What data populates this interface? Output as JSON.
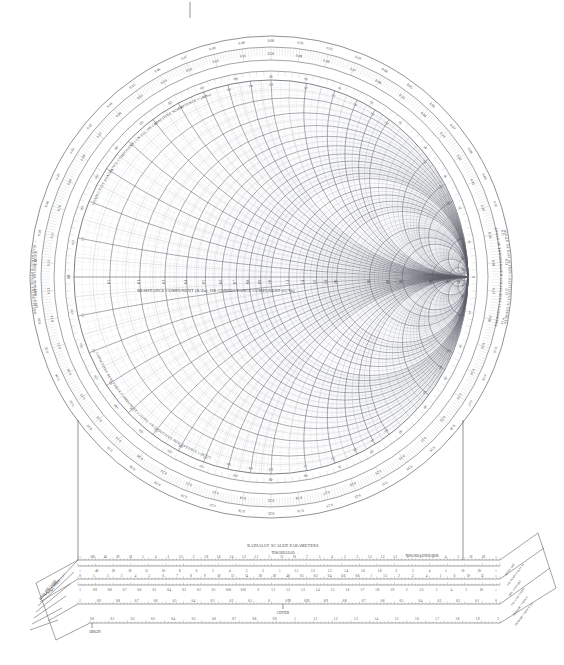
{
  "chart_data": {
    "type": "smith-chart",
    "center_label": "RESISTANCE COMPONENT (R/Zo), OR CONDUCTANCE COMPONENT (G/Yo)",
    "arc_labels": {
      "upper_left": "INDUCTIVE REACTANCE COMPONENT (+jX/Zo), OR CAPACITIVE SUSCEPTANCE (+jB/Yo)",
      "lower_left": "CAPACITIVE REACTANCE COMPONENT (-jX/Zo), OR INDUCTIVE SUSCEPTANCE (-jB/Yo)",
      "outer_left_upper": "WAVELENGTHS TOWARD GENERATOR →",
      "outer_left_lower": "← WAVELENGTHS TOWARD LOAD",
      "outer_right_upper": "ANGLE OF REFLECTION COEFFICIENT IN DEGREES",
      "outer_right_lower": "ANGLE OF TRANSMISSION COEFFICIENT IN DEGREES"
    },
    "resistance_circles": [
      0,
      0.1,
      0.2,
      0.3,
      0.4,
      0.5,
      0.6,
      0.7,
      0.8,
      0.9,
      1.0,
      1.2,
      1.4,
      1.6,
      1.8,
      2.0,
      3.0,
      4.0,
      5.0,
      10.0,
      20.0,
      50.0
    ],
    "resistance_minor": [
      0.05,
      0.15,
      0.25,
      0.35,
      0.45,
      0.55,
      0.65,
      0.75,
      0.85,
      0.95,
      1.1,
      1.3,
      1.5,
      1.7,
      1.9,
      2.2,
      2.4,
      2.6,
      2.8,
      3.2,
      3.4,
      3.6,
      3.8,
      4.5,
      6,
      7,
      8,
      9,
      12,
      14,
      16,
      18,
      30,
      40
    ],
    "reactance_arcs": [
      0.1,
      0.2,
      0.3,
      0.4,
      0.5,
      0.6,
      0.7,
      0.8,
      0.9,
      1.0,
      1.2,
      1.4,
      1.6,
      1.8,
      2.0,
      3.0,
      4.0,
      5.0,
      10.0,
      20.0,
      50.0
    ],
    "reactance_minor": [
      0.05,
      0.15,
      0.25,
      0.35,
      0.45,
      0.55,
      0.65,
      0.75,
      0.85,
      0.95,
      1.1,
      1.3,
      1.5,
      1.7,
      1.9,
      2.2,
      2.4,
      2.6,
      2.8,
      3.2,
      3.4,
      3.6,
      3.8,
      4.5,
      6,
      7,
      8,
      9,
      12,
      14,
      16,
      18,
      30,
      40
    ],
    "axis_tick_labels": [
      "0.1",
      "0.2",
      "0.3",
      "0.4",
      "0.5",
      "0.6",
      "0.7",
      "0.8",
      "0.9",
      "1.0",
      "1.2",
      "1.4",
      "1.6",
      "1.8",
      "2.0",
      "3.0",
      "4.0",
      "5.0",
      "10",
      "20",
      "50"
    ],
    "reactance_tick_labels": [
      "0.1",
      "0.2",
      "0.3",
      "0.4",
      "0.5",
      "0.6",
      "0.7",
      "0.8",
      "0.9",
      "1.0",
      "1.2",
      "1.4",
      "1.6",
      "1.8",
      "2.0",
      "3.0",
      "4.0",
      "5.0",
      "10",
      "20",
      "50"
    ],
    "wavelengths_toward_generator": [
      "0.00",
      "0.01",
      "0.02",
      "0.03",
      "0.04",
      "0.05",
      "0.06",
      "0.07",
      "0.08",
      "0.09",
      "0.10",
      "0.11",
      "0.12",
      "0.13",
      "0.14",
      "0.15",
      "0.16",
      "0.17",
      "0.18",
      "0.19",
      "0.20",
      "0.21",
      "0.22",
      "0.23",
      "0.24",
      "0.25",
      "0.26",
      "0.27",
      "0.28",
      "0.29",
      "0.30",
      "0.31",
      "0.32",
      "0.33",
      "0.34",
      "0.35",
      "0.36",
      "0.37",
      "0.38",
      "0.39",
      "0.40",
      "0.41",
      "0.42",
      "0.43",
      "0.44",
      "0.45",
      "0.46",
      "0.47",
      "0.48",
      "0.49"
    ],
    "wavelengths_toward_load": [
      "0.50",
      "0.49",
      "0.48",
      "0.47",
      "0.46",
      "0.45",
      "0.44",
      "0.43",
      "0.42",
      "0.41",
      "0.40",
      "0.39",
      "0.38",
      "0.37",
      "0.36",
      "0.35",
      "0.34",
      "0.33",
      "0.32",
      "0.31",
      "0.30",
      "0.29",
      "0.28",
      "0.27",
      "0.26",
      "0.25",
      "0.24",
      "0.23",
      "0.22",
      "0.21",
      "0.20",
      "0.19",
      "0.18",
      "0.17",
      "0.16",
      "0.15",
      "0.14",
      "0.13",
      "0.12",
      "0.11",
      "0.10",
      "0.09",
      "0.08",
      "0.07",
      "0.06",
      "0.05",
      "0.04",
      "0.03",
      "0.02",
      "0.01"
    ],
    "angle_degrees": [
      0,
      10,
      20,
      30,
      40,
      50,
      60,
      70,
      80,
      90,
      100,
      110,
      120,
      130,
      140,
      150,
      160,
      170,
      180,
      -170,
      -160,
      -150,
      -140,
      -130,
      -120,
      -110,
      -100,
      -90,
      -80,
      -70,
      -60,
      -50,
      -40,
      -30,
      -20,
      -10
    ],
    "angle_degrees_inner": [
      0,
      15,
      30,
      45,
      60,
      75,
      90,
      105,
      120,
      135,
      150,
      165,
      180,
      -165,
      -150,
      -135,
      -120,
      -105,
      -90,
      -75,
      -60,
      -45,
      -30,
      -15
    ],
    "colors": {
      "grid_major": "#5a5a66",
      "grid_minor": "#9aa0aa",
      "grid_fine": "#c3c7cf",
      "text": "#2b2b2b",
      "border": "#444a52",
      "background": "#ffffff"
    }
  },
  "radially_scaled": {
    "title": "RADIALLY SCALED PARAMETERS",
    "toward_load": "TOWARD LOAD →",
    "toward_generator": "← TOWARD GENERATOR",
    "center_mark": "CENTER",
    "origin_mark": "ORIGIN",
    "left_labels": [
      "ATTEN. [dB]",
      "S.W. LOSS COEFF",
      "RFL. LOSS [dB]",
      "RFL. COEFF. P",
      "RFL. COEFF. E or I"
    ],
    "right_labels": [
      "ATTEN. [dB]",
      "S.W. PEAK (CONST. P)",
      "RFL. LOSS [dB]",
      "S.W. LOSS COEFF",
      "TRANSM. COEFF. P",
      "TRANSM. COEFF. E or I"
    ],
    "scales": [
      {
        "name": "attenuation-swr-top",
        "upper_ticks": [
          "∞",
          "100",
          "40",
          "20",
          "10",
          "5",
          "4",
          "3",
          "2.5",
          "2",
          "1.8",
          "1.6",
          "1.4",
          "1.2",
          "1.1",
          "1",
          "15",
          "10",
          "7",
          "5",
          "4",
          "3",
          "2",
          "1.5",
          "1.2",
          "1.1",
          "1",
          "2",
          "3",
          "4",
          "5",
          "10",
          "20",
          "∞"
        ],
        "lower_ticks": [
          "∞",
          "40",
          "30",
          "20",
          "15",
          "10",
          "8",
          "6",
          "5",
          "4",
          "3",
          "2",
          "1",
          "1.1",
          "1.2",
          "1.3",
          "1.4",
          "1.6",
          "1.8",
          "2",
          "3",
          "4",
          "5",
          "10",
          "20",
          "∞"
        ]
      },
      {
        "name": "loss-coefficient",
        "upper_ticks": [
          "0",
          "1",
          "2",
          "3",
          "4",
          "5",
          "6",
          "7",
          "8",
          "9",
          "10",
          "12",
          "14",
          "20",
          "30",
          "40",
          "0.1",
          "0.2",
          "0.4",
          "0.6",
          "0.8",
          "1",
          "1.5",
          "2",
          "3",
          "4",
          "5",
          "6",
          "10",
          "15",
          "∞"
        ],
        "lower_ticks": [
          "1",
          "0.9",
          "0.8",
          "0.7",
          "0.6",
          "0.5",
          "0.4",
          "0.3",
          "0.2",
          "0.1",
          "0.05",
          "0.01",
          "0",
          "1.1",
          "1.2",
          "1.3",
          "1.4",
          "1.5",
          "1.6",
          "1.7",
          "1.8",
          "1.9",
          "2",
          "2.5",
          "3",
          "4",
          "5",
          "10",
          "∞"
        ]
      },
      {
        "name": "reflection-coefficient",
        "ticks": [
          "1",
          "0.9",
          "0.8",
          "0.7",
          "0.6",
          "0.5",
          "0.4",
          "0.3",
          "0.2",
          "0.1",
          "0",
          "0.99",
          "0.95",
          "0.9",
          "0.8",
          "0.7",
          "0.6",
          "0.5",
          "0.4",
          "0.3",
          "0.2",
          "0.1",
          "0"
        ]
      },
      {
        "name": "transmission-coefficient",
        "ticks": [
          "0.0",
          "0.1",
          "0.2",
          "0.3",
          "0.4",
          "0.5",
          "0.6",
          "0.7",
          "0.8",
          "0.9",
          "1",
          "1.1",
          "1.2",
          "1.3",
          "1.4",
          "1.5",
          "1.6",
          "1.7",
          "1.8",
          "1.9",
          "2"
        ]
      }
    ]
  },
  "top_tick_marker": "|"
}
